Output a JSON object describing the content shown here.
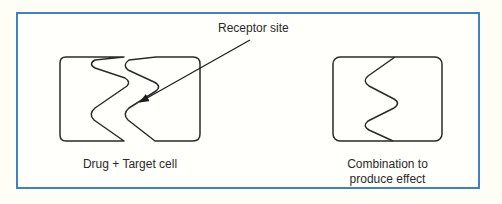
{
  "diagram": {
    "type": "drug-receptor illustration",
    "labels": {
      "receptor_site": "Receptor site",
      "left_caption": "Drug + Target cell",
      "right_caption_line1": "Combination to",
      "right_caption_line2": "produce effect"
    },
    "colors": {
      "frame_border": "#3d82c6",
      "stroke": "#2a2a2a",
      "background": "#fffffb"
    }
  }
}
